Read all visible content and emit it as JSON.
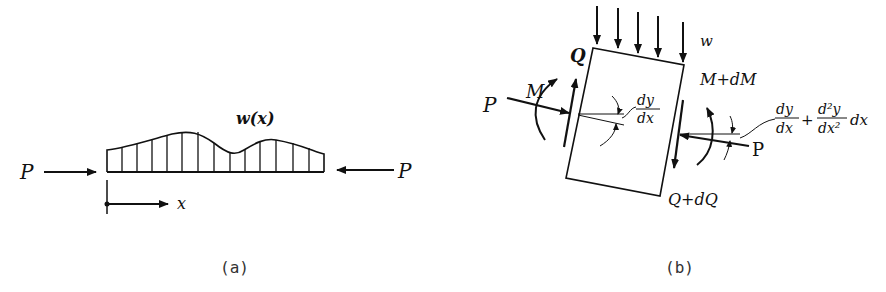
{
  "figure_a": {
    "caption": "(a)",
    "load_label": "w(x)",
    "left_force_label": "P",
    "right_force_label": "P",
    "axis_label": "x"
  },
  "figure_b": {
    "caption": "(b)",
    "distributed_load_label": "w",
    "left_shear_label": "Q",
    "left_moment_label": "M",
    "left_force_label": "P",
    "right_moment_label": "M+dM",
    "right_shear_label": "Q+dQ",
    "right_force_label": "P",
    "left_slope_num": "dy",
    "left_slope_den": "dx",
    "right_slope_num1": "dy",
    "right_slope_den1": "dx",
    "right_slope_plus": "+",
    "right_slope_num2": "d²y",
    "right_slope_den2": "dx²",
    "right_slope_tail": "dx"
  },
  "colors": {
    "ink": "#111111",
    "background": "#ffffff"
  }
}
